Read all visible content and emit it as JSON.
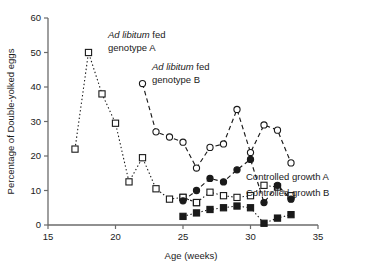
{
  "chart_data": {
    "type": "line",
    "title": "",
    "xlabel": "Age (weeks)",
    "ylabel": "Percentage of Double-yolked eggs",
    "xlim": [
      15,
      35
    ],
    "ylim": [
      0,
      60
    ],
    "xticks": [
      15,
      20,
      25,
      30,
      35
    ],
    "yticks": [
      0,
      10,
      20,
      30,
      40,
      50,
      60
    ],
    "grid": false,
    "legend_position": "inline-right",
    "annotations": [
      {
        "id": "ann-a",
        "text_italic": "Ad libitum",
        "text_rest": " fed",
        "line2": "genotype A",
        "x": 108,
        "y": 38
      },
      {
        "id": "ann-b",
        "text_italic": "Ad libitum",
        "text_rest": " fed",
        "line2": "genotype B",
        "x": 152,
        "y": 70
      }
    ],
    "series": [
      {
        "name": "Ad libitum fed genotype A",
        "marker": "open-square",
        "dash": "dotted",
        "x": [
          17,
          18,
          19,
          20,
          21,
          22,
          23,
          24,
          25,
          26
        ],
        "y": [
          22.0,
          50.0,
          38.0,
          29.5,
          12.5,
          19.5,
          10.5,
          7.5,
          8.0,
          6.5
        ]
      },
      {
        "name": "Ad libitum fed genotype B",
        "marker": "open-circle",
        "dash": "dashed",
        "x": [
          22,
          23,
          24,
          25,
          26,
          27,
          28,
          29,
          30,
          31,
          32,
          33
        ],
        "y": [
          41.0,
          27.0,
          25.5,
          24.0,
          16.5,
          22.5,
          23.5,
          33.5,
          21.0,
          29.0,
          27.5,
          18.0
        ]
      },
      {
        "name": "Controlled growth A",
        "marker": "open-square",
        "dash": "dotted",
        "x": [
          25,
          26,
          27,
          28,
          29,
          30,
          31,
          32,
          33
        ],
        "y": [
          8.0,
          6.5,
          9.5,
          8.5,
          8.0,
          8.5,
          11.5,
          11.0,
          8.5
        ]
      },
      {
        "name": "Controlled growth B",
        "marker": "filled-square",
        "dash": "dotted",
        "x": [
          25,
          26,
          27,
          28,
          29,
          30,
          31,
          32,
          33
        ],
        "y": [
          2.5,
          3.5,
          4.5,
          5.0,
          5.5,
          5.0,
          0.5,
          2.0,
          3.0
        ]
      },
      {
        "name": "Controlled growth filled-circle",
        "marker": "filled-circle",
        "dash": "dashed",
        "x": [
          25,
          26,
          27,
          28,
          29,
          30,
          31,
          32,
          33
        ],
        "y": [
          7.0,
          10.0,
          13.5,
          12.5,
          16.0,
          19.0,
          6.5,
          11.5,
          7.5
        ]
      }
    ],
    "legend": [
      {
        "label": "Controlled growth A",
        "marker": "open-square"
      },
      {
        "label": "Controlled growth B",
        "marker": "filled-square"
      }
    ]
  }
}
